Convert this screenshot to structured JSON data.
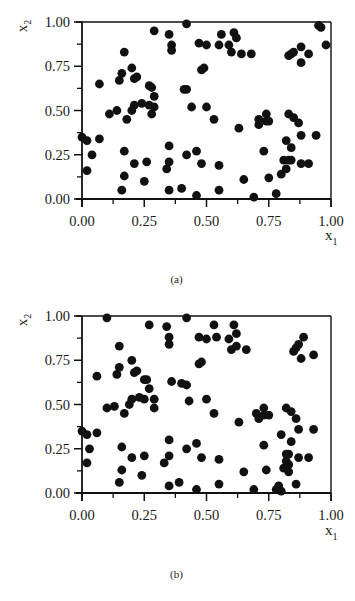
{
  "chart_data": [
    {
      "type": "scatter",
      "panel": "(a)",
      "caption": "(a)",
      "xlabel": "x1",
      "ylabel": "x2",
      "xlim": [
        0,
        1
      ],
      "ylim": [
        0,
        1
      ],
      "xticks": [
        "0.00",
        "0.25",
        "0.50",
        "0.75",
        "1.00"
      ],
      "yticks": [
        "0.00",
        "0.25",
        "0.50",
        "0.75",
        "1.00"
      ],
      "grid": false,
      "marker_color": "#111111",
      "points": [
        [
          0.29,
          0.95
        ],
        [
          0.35,
          0.93
        ],
        [
          0.36,
          0.87
        ],
        [
          0.36,
          0.84
        ],
        [
          0.42,
          0.99
        ],
        [
          0.47,
          0.88
        ],
        [
          0.5,
          0.87
        ],
        [
          0.55,
          0.87
        ],
        [
          0.56,
          0.93
        ],
        [
          0.59,
          0.87
        ],
        [
          0.6,
          0.83
        ],
        [
          0.61,
          0.94
        ],
        [
          0.62,
          0.91
        ],
        [
          0.64,
          0.82
        ],
        [
          0.68,
          0.82
        ],
        [
          0.83,
          0.81
        ],
        [
          0.84,
          0.82
        ],
        [
          0.85,
          0.83
        ],
        [
          0.88,
          0.86
        ],
        [
          0.88,
          0.77
        ],
        [
          0.91,
          0.82
        ],
        [
          0.95,
          0.98
        ],
        [
          0.96,
          0.97
        ],
        [
          0.98,
          0.87
        ],
        [
          0.17,
          0.83
        ],
        [
          0.16,
          0.71
        ],
        [
          0.15,
          0.67
        ],
        [
          0.2,
          0.74
        ],
        [
          0.21,
          0.68
        ],
        [
          0.22,
          0.69
        ],
        [
          0.07,
          0.65
        ],
        [
          0.27,
          0.64
        ],
        [
          0.28,
          0.63
        ],
        [
          0.48,
          0.73
        ],
        [
          0.49,
          0.74
        ],
        [
          0.42,
          0.62
        ],
        [
          0.44,
          0.52
        ],
        [
          0.29,
          0.58
        ],
        [
          0.29,
          0.52
        ],
        [
          0.28,
          0.48
        ],
        [
          0.11,
          0.48
        ],
        [
          0.14,
          0.5
        ],
        [
          0.18,
          0.45
        ],
        [
          0.2,
          0.5
        ],
        [
          0.21,
          0.53
        ],
        [
          0.24,
          0.54
        ],
        [
          0.27,
          0.53
        ],
        [
          0.41,
          0.62
        ],
        [
          0.5,
          0.52
        ],
        [
          0.53,
          0.45
        ],
        [
          0.63,
          0.4
        ],
        [
          0.71,
          0.45
        ],
        [
          0.71,
          0.42
        ],
        [
          0.74,
          0.48
        ],
        [
          0.74,
          0.44
        ],
        [
          0.75,
          0.44
        ],
        [
          0.83,
          0.48
        ],
        [
          0.85,
          0.46
        ],
        [
          0.82,
          0.33
        ],
        [
          0.87,
          0.43
        ],
        [
          0.88,
          0.36
        ],
        [
          0.94,
          0.36
        ],
        [
          0.0,
          0.35
        ],
        [
          0.02,
          0.33
        ],
        [
          0.07,
          0.34
        ],
        [
          0.04,
          0.25
        ],
        [
          0.02,
          0.16
        ],
        [
          0.17,
          0.27
        ],
        [
          0.17,
          0.13
        ],
        [
          0.16,
          0.05
        ],
        [
          0.21,
          0.2
        ],
        [
          0.25,
          0.1
        ],
        [
          0.26,
          0.21
        ],
        [
          0.34,
          0.17
        ],
        [
          0.35,
          0.21
        ],
        [
          0.35,
          0.3
        ],
        [
          0.35,
          0.05
        ],
        [
          0.4,
          0.06
        ],
        [
          0.42,
          0.25
        ],
        [
          0.46,
          0.27
        ],
        [
          0.48,
          0.2
        ],
        [
          0.46,
          0.02
        ],
        [
          0.55,
          0.19
        ],
        [
          0.55,
          0.05
        ],
        [
          0.65,
          0.11
        ],
        [
          0.69,
          0.01
        ],
        [
          0.75,
          0.12
        ],
        [
          0.73,
          0.27
        ],
        [
          0.8,
          0.14
        ],
        [
          0.81,
          0.22
        ],
        [
          0.83,
          0.22
        ],
        [
          0.82,
          0.17
        ],
        [
          0.84,
          0.22
        ],
        [
          0.84,
          0.29
        ],
        [
          0.88,
          0.2
        ],
        [
          0.91,
          0.2
        ],
        [
          0.78,
          0.03
        ]
      ]
    },
    {
      "type": "scatter",
      "panel": "(b)",
      "caption": "(b)",
      "xlabel": "x1",
      "ylabel": "x2",
      "xlim": [
        0,
        1
      ],
      "ylim": [
        0,
        1
      ],
      "xticks": [
        "0.00",
        "0.25",
        "0.50",
        "0.75",
        "1.00"
      ],
      "yticks": [
        "0.00",
        "0.25",
        "0.50",
        "0.75",
        "1.00"
      ],
      "grid": false,
      "marker_color": "#111111",
      "points": [
        [
          0.1,
          0.99
        ],
        [
          0.27,
          0.95
        ],
        [
          0.34,
          0.94
        ],
        [
          0.35,
          0.88
        ],
        [
          0.35,
          0.84
        ],
        [
          0.42,
          0.99
        ],
        [
          0.47,
          0.88
        ],
        [
          0.5,
          0.87
        ],
        [
          0.53,
          0.95
        ],
        [
          0.54,
          0.88
        ],
        [
          0.59,
          0.87
        ],
        [
          0.6,
          0.81
        ],
        [
          0.61,
          0.95
        ],
        [
          0.62,
          0.9
        ],
        [
          0.62,
          0.83
        ],
        [
          0.66,
          0.81
        ],
        [
          0.85,
          0.8
        ],
        [
          0.86,
          0.82
        ],
        [
          0.87,
          0.84
        ],
        [
          0.89,
          0.88
        ],
        [
          0.88,
          0.76
        ],
        [
          0.93,
          0.78
        ],
        [
          0.15,
          0.83
        ],
        [
          0.15,
          0.71
        ],
        [
          0.14,
          0.67
        ],
        [
          0.2,
          0.75
        ],
        [
          0.21,
          0.68
        ],
        [
          0.22,
          0.69
        ],
        [
          0.06,
          0.66
        ],
        [
          0.25,
          0.64
        ],
        [
          0.27,
          0.59
        ],
        [
          0.48,
          0.74
        ],
        [
          0.47,
          0.73
        ],
        [
          0.42,
          0.61
        ],
        [
          0.43,
          0.52
        ],
        [
          0.29,
          0.53
        ],
        [
          0.29,
          0.48
        ],
        [
          0.36,
          0.63
        ],
        [
          0.26,
          0.64
        ],
        [
          0.1,
          0.48
        ],
        [
          0.13,
          0.49
        ],
        [
          0.17,
          0.45
        ],
        [
          0.19,
          0.5
        ],
        [
          0.2,
          0.53
        ],
        [
          0.23,
          0.54
        ],
        [
          0.25,
          0.53
        ],
        [
          0.4,
          0.62
        ],
        [
          0.53,
          0.45
        ],
        [
          0.5,
          0.53
        ],
        [
          0.63,
          0.4
        ],
        [
          0.7,
          0.45
        ],
        [
          0.71,
          0.42
        ],
        [
          0.73,
          0.48
        ],
        [
          0.73,
          0.44
        ],
        [
          0.75,
          0.44
        ],
        [
          0.82,
          0.48
        ],
        [
          0.84,
          0.46
        ],
        [
          0.8,
          0.33
        ],
        [
          0.86,
          0.42
        ],
        [
          0.87,
          0.36
        ],
        [
          0.93,
          0.36
        ],
        [
          0.0,
          0.35
        ],
        [
          0.02,
          0.33
        ],
        [
          0.06,
          0.34
        ],
        [
          0.03,
          0.25
        ],
        [
          0.02,
          0.17
        ],
        [
          0.16,
          0.26
        ],
        [
          0.16,
          0.13
        ],
        [
          0.15,
          0.06
        ],
        [
          0.2,
          0.2
        ],
        [
          0.24,
          0.1
        ],
        [
          0.25,
          0.21
        ],
        [
          0.33,
          0.17
        ],
        [
          0.35,
          0.21
        ],
        [
          0.35,
          0.3
        ],
        [
          0.35,
          0.04
        ],
        [
          0.39,
          0.06
        ],
        [
          0.42,
          0.25
        ],
        [
          0.46,
          0.28
        ],
        [
          0.48,
          0.2
        ],
        [
          0.46,
          0.02
        ],
        [
          0.55,
          0.19
        ],
        [
          0.55,
          0.05
        ],
        [
          0.65,
          0.12
        ],
        [
          0.69,
          0.02
        ],
        [
          0.74,
          0.13
        ],
        [
          0.73,
          0.27
        ],
        [
          0.79,
          0.04
        ],
        [
          0.78,
          0.02
        ],
        [
          0.8,
          0.01
        ],
        [
          0.81,
          0.14
        ],
        [
          0.82,
          0.22
        ],
        [
          0.83,
          0.22
        ],
        [
          0.82,
          0.18
        ],
        [
          0.83,
          0.16
        ],
        [
          0.83,
          0.12
        ],
        [
          0.84,
          0.29
        ],
        [
          0.87,
          0.2
        ],
        [
          0.91,
          0.2
        ],
        [
          0.86,
          0.05
        ]
      ]
    }
  ],
  "panels": [
    {
      "caption": "(a)",
      "xlabel": "x",
      "xlabel_sub": "1",
      "ylabel": "x",
      "ylabel_sub": "2"
    },
    {
      "caption": "(b)",
      "xlabel": "x",
      "xlabel_sub": "1",
      "ylabel": "x",
      "ylabel_sub": "2"
    }
  ]
}
